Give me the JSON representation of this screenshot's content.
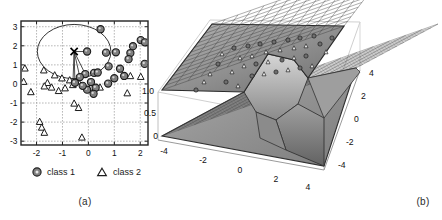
{
  "figure": {
    "panels": [
      {
        "id": "a",
        "caption": "(a)"
      },
      {
        "id": "b",
        "caption": "(b)"
      }
    ]
  },
  "chart_data": [
    {
      "type": "scatter",
      "panel": "a",
      "title": "",
      "xlabel": "",
      "ylabel": "",
      "xlim": [
        -2.6,
        2.3
      ],
      "ylim": [
        -3.2,
        3.3
      ],
      "xticks": [
        "-2",
        "-1",
        "0",
        "1",
        "2"
      ],
      "xtick_values": [
        -2,
        -1,
        0,
        1,
        2
      ],
      "yticks": [
        "3",
        "2",
        "1",
        "0",
        "-1",
        "-2",
        "-3"
      ],
      "ytick_values": [
        3,
        2,
        1,
        0,
        -1,
        -2,
        -3
      ],
      "grid": true,
      "legend_position": "below",
      "legend": [
        {
          "label": "class 1",
          "marker": "filled-circle",
          "color": "#7a7a7a"
        },
        {
          "label": "class 2",
          "marker": "open-triangle",
          "color": "#ffffff"
        }
      ],
      "series": [
        {
          "name": "class 1",
          "marker": "filled-circle",
          "color": "#808080",
          "points": [
            [
              0.47,
              2.87
            ],
            [
              2.02,
              2.3
            ],
            [
              2.18,
              2.18
            ],
            [
              1.72,
              1.98
            ],
            [
              1.62,
              1.62
            ],
            [
              1.06,
              1.66
            ],
            [
              0.68,
              1.64
            ],
            [
              -0.05,
              1.7
            ],
            [
              1.55,
              1.3
            ],
            [
              2.17,
              1.05
            ],
            [
              0.78,
              0.92
            ],
            [
              1.22,
              0.8
            ],
            [
              0.22,
              0.58
            ],
            [
              -0.12,
              0.52
            ],
            [
              -0.33,
              0.36
            ],
            [
              0.36,
              0.6
            ],
            [
              1.0,
              0.3
            ],
            [
              1.38,
              0.42
            ],
            [
              -0.52,
              0.06
            ],
            [
              0.1,
              0.1
            ],
            [
              0.76,
              0.02
            ],
            [
              0.28,
              -0.2
            ],
            [
              -0.05,
              -0.3
            ],
            [
              0.2,
              -0.52
            ],
            [
              -0.22,
              -0.1
            ]
          ]
        },
        {
          "name": "class 2",
          "marker": "open-triangle",
          "color": "#ffffff",
          "points": [
            [
              -2.45,
              0.82
            ],
            [
              -2.5,
              0.12
            ],
            [
              -1.72,
              0.72
            ],
            [
              -1.3,
              0.46
            ],
            [
              -1.02,
              0.3
            ],
            [
              -0.72,
              0.2
            ],
            [
              -0.4,
              0.14
            ],
            [
              -1.58,
              0.06
            ],
            [
              -2.22,
              -0.42
            ],
            [
              -1.7,
              -0.12
            ],
            [
              -1.42,
              -0.18
            ],
            [
              -1.15,
              -0.36
            ],
            [
              -0.9,
              -0.22
            ],
            [
              0.1,
              -0.18
            ],
            [
              0.45,
              -0.18
            ],
            [
              1.62,
              0.42
            ],
            [
              2.02,
              0.38
            ],
            [
              1.5,
              -0.48
            ],
            [
              -0.55,
              -1.02
            ],
            [
              -0.38,
              -1.25
            ],
            [
              -1.88,
              -1.98
            ],
            [
              -1.8,
              -2.28
            ],
            [
              -1.7,
              -2.55
            ],
            [
              -0.25,
              -2.8
            ],
            [
              -0.6,
              -0.05
            ]
          ]
        },
        {
          "name": "query-point",
          "marker": "cross",
          "color": "#000000",
          "points": [
            [
              -0.55,
              1.7
            ]
          ]
        }
      ],
      "annotations": {
        "circle_neighborhood": {
          "center": [
            -0.55,
            1.7
          ],
          "radius_x": 1.42,
          "radius_y": 1.42
        },
        "links_from_query": [
          [
            -0.05,
            1.7
          ],
          [
            -0.12,
            0.52
          ],
          [
            -0.33,
            0.36
          ],
          [
            -0.52,
            0.06
          ],
          [
            -0.6,
            -0.05
          ]
        ]
      }
    },
    {
      "type": "surface",
      "panel": "b",
      "title": "",
      "xlabel": "",
      "ylabel": "",
      "zlabel": "",
      "xticks": [
        "-4",
        "-2",
        "0",
        "2",
        "4"
      ],
      "xtick_values": [
        -4,
        -2,
        0,
        2,
        4
      ],
      "yticks": [
        "4",
        "2",
        "0",
        "-2",
        "-4"
      ],
      "ytick_values": [
        4,
        2,
        0,
        -2,
        -4
      ],
      "zticks": [
        "1.0",
        "0.5",
        "0"
      ],
      "ztick_values": [
        1.0,
        0.5,
        0.0
      ],
      "zlim": [
        0,
        1
      ],
      "grid": true,
      "description": "Decision-surface mesh with an upper plateau at z=1 and a lower plateau at z=0 joined by a steep ridge; class markers sit on the upper plateau.",
      "surface_colors": {
        "mesh": "#3a3a3a",
        "face_light": "#cfcfcf",
        "face_mid": "#9a9a9a",
        "face_dark": "#6e6e6e"
      }
    }
  ]
}
